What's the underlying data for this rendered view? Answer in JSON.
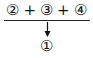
{
  "diagram": {
    "sum_terms": [
      "②",
      "③",
      "④"
    ],
    "operator": "+",
    "result": "①",
    "arrow_direction": "down",
    "line_color": "#222222"
  }
}
